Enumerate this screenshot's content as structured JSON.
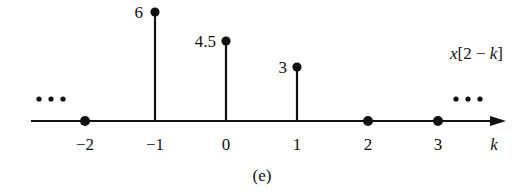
{
  "chart_data": {
    "type": "stem",
    "title": "",
    "subtitle": "(e)",
    "series_label": "x[2 − k]",
    "xlabel": "k",
    "ylabel": "",
    "x_ticks": [
      "−2",
      "−1",
      "0",
      "1",
      "2",
      "3"
    ],
    "points": [
      {
        "k": -2,
        "value": 0,
        "label": ""
      },
      {
        "k": -1,
        "value": 6,
        "label": "6"
      },
      {
        "k": 0,
        "value": 4.5,
        "label": "4.5"
      },
      {
        "k": 1,
        "value": 3,
        "label": "3"
      },
      {
        "k": 2,
        "value": 0,
        "label": ""
      },
      {
        "k": 3,
        "value": 0,
        "label": ""
      }
    ],
    "continuation_left": "…",
    "continuation_right": "…",
    "grid": false,
    "legend": "none"
  },
  "labels": {
    "series": "x[2 − k]",
    "axis": "k",
    "caption": "(e)",
    "tick_m2": "−2",
    "tick_m1": "−1",
    "tick_0": "0",
    "tick_1": "1",
    "tick_2": "2",
    "tick_3": "3",
    "val_m1": "6",
    "val_0": "4.5",
    "val_1": "3"
  }
}
